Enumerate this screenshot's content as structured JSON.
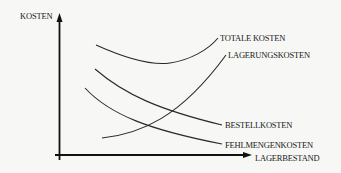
{
  "diagram": {
    "y_axis_label": "KOSTEN",
    "x_axis_label": "LAGERBESTAND",
    "curves": [
      {
        "id": "totale-kosten",
        "label": "TOTALE KOSTEN",
        "shape": "U-shaped"
      },
      {
        "id": "lagerungskosten",
        "label": "LAGERUNGSKOSTEN",
        "shape": "increasing"
      },
      {
        "id": "bestellkosten",
        "label": "BESTELLKOSTEN",
        "shape": "decreasing"
      },
      {
        "id": "fehlmengenkosten",
        "label": "FEHLMENGENKOSTEN",
        "shape": "decreasing"
      }
    ],
    "colors": {
      "ink": "#1a1a1a",
      "background": "#f7f7f5"
    }
  }
}
